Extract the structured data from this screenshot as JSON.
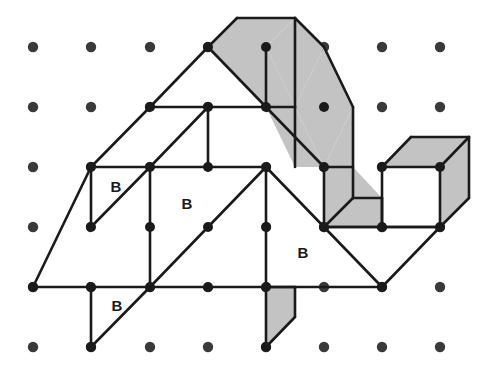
{
  "figure": {
    "background_color": "#ffffff",
    "line_color": "#1a1a1a",
    "dot_color": "#3a3a3a",
    "shaded_color": "#c3c3c3",
    "plain_color": "#ffffff",
    "line_width": 2.6,
    "dot_radius": 5.2,
    "vertex_radius": 5.0
  },
  "grid": {
    "columns": 8,
    "rows": 6,
    "origin_x": 33,
    "origin_y": 47,
    "spacing_x": 58.2,
    "spacing_y": 60.0,
    "dots": [
      {
        "col": 0,
        "row": 0,
        "x": 33,
        "y": 47
      },
      {
        "col": 1,
        "row": 0,
        "x": 91,
        "y": 47
      },
      {
        "col": 2,
        "row": 0,
        "x": 150,
        "y": 47
      },
      {
        "col": 3,
        "row": 0,
        "x": 208,
        "y": 47
      },
      {
        "col": 4,
        "row": 0,
        "x": 266,
        "y": 47
      },
      {
        "col": 5,
        "row": 0,
        "x": 324,
        "y": 47
      },
      {
        "col": 6,
        "row": 0,
        "x": 382,
        "y": 47
      },
      {
        "col": 7,
        "row": 0,
        "x": 440,
        "y": 47
      },
      {
        "col": 0,
        "row": 1,
        "x": 33,
        "y": 107
      },
      {
        "col": 1,
        "row": 1,
        "x": 91,
        "y": 107
      },
      {
        "col": 2,
        "row": 1,
        "x": 150,
        "y": 107
      },
      {
        "col": 3,
        "row": 1,
        "x": 208,
        "y": 107
      },
      {
        "col": 4,
        "row": 1,
        "x": 266,
        "y": 107
      },
      {
        "col": 5,
        "row": 1,
        "x": 324,
        "y": 107
      },
      {
        "col": 6,
        "row": 1,
        "x": 382,
        "y": 107
      },
      {
        "col": 7,
        "row": 1,
        "x": 440,
        "y": 107
      },
      {
        "col": 0,
        "row": 2,
        "x": 33,
        "y": 167
      },
      {
        "col": 1,
        "row": 2,
        "x": 91,
        "y": 167
      },
      {
        "col": 2,
        "row": 2,
        "x": 150,
        "y": 167
      },
      {
        "col": 3,
        "row": 2,
        "x": 208,
        "y": 167
      },
      {
        "col": 4,
        "row": 2,
        "x": 266,
        "y": 167
      },
      {
        "col": 5,
        "row": 2,
        "x": 324,
        "y": 167
      },
      {
        "col": 6,
        "row": 2,
        "x": 382,
        "y": 167
      },
      {
        "col": 7,
        "row": 2,
        "x": 440,
        "y": 167
      },
      {
        "col": 0,
        "row": 3,
        "x": 33,
        "y": 227
      },
      {
        "col": 1,
        "row": 3,
        "x": 91,
        "y": 227
      },
      {
        "col": 2,
        "row": 3,
        "x": 150,
        "y": 227
      },
      {
        "col": 3,
        "row": 3,
        "x": 208,
        "y": 227
      },
      {
        "col": 4,
        "row": 3,
        "x": 266,
        "y": 227
      },
      {
        "col": 5,
        "row": 3,
        "x": 324,
        "y": 227
      },
      {
        "col": 6,
        "row": 3,
        "x": 382,
        "y": 227
      },
      {
        "col": 7,
        "row": 3,
        "x": 440,
        "y": 227
      },
      {
        "col": 0,
        "row": 4,
        "x": 33,
        "y": 287
      },
      {
        "col": 1,
        "row": 4,
        "x": 91,
        "y": 287
      },
      {
        "col": 2,
        "row": 4,
        "x": 150,
        "y": 287
      },
      {
        "col": 3,
        "row": 4,
        "x": 208,
        "y": 287
      },
      {
        "col": 4,
        "row": 4,
        "x": 266,
        "y": 287
      },
      {
        "col": 5,
        "row": 4,
        "x": 324,
        "y": 287
      },
      {
        "col": 6,
        "row": 4,
        "x": 382,
        "y": 287
      },
      {
        "col": 7,
        "row": 4,
        "x": 440,
        "y": 287
      },
      {
        "col": 0,
        "row": 5,
        "x": 33,
        "y": 347
      },
      {
        "col": 1,
        "row": 5,
        "x": 91,
        "y": 347
      },
      {
        "col": 2,
        "row": 5,
        "x": 150,
        "y": 347
      },
      {
        "col": 3,
        "row": 5,
        "x": 208,
        "y": 347
      },
      {
        "col": 4,
        "row": 5,
        "x": 266,
        "y": 347
      },
      {
        "col": 5,
        "row": 5,
        "x": 324,
        "y": 347
      },
      {
        "col": 6,
        "row": 5,
        "x": 382,
        "y": 347
      },
      {
        "col": 7,
        "row": 5,
        "x": 440,
        "y": 347
      }
    ]
  },
  "shaded_faces": [
    {
      "id": "top-band-left",
      "points": "208,47 237,18 295,18 266,47"
    },
    {
      "id": "top-band-left-lower",
      "points": "208,47 266,47 295,107 266,107"
    },
    {
      "id": "top-band-mid",
      "points": "266,47 295,18 324,47 295,107"
    },
    {
      "id": "top-band-mid-lower",
      "points": "266,107 295,107 324,167 295,167"
    },
    {
      "id": "top-band-right",
      "points": "295,107 324,47 353,107 324,167"
    },
    {
      "id": "band-right-side",
      "points": "324,167 353,107 353,170 324,227"
    },
    {
      "id": "band-side-lower",
      "points": "324,167 324,227 353,227 353,167"
    },
    {
      "id": "elbow-bottom",
      "points": "324,227 353,227 382,227 382,198 353,198"
    },
    {
      "id": "elbow-inner",
      "points": "324,227 324,167 353,167 382,198 353,198 353,227"
    },
    {
      "id": "cube-top",
      "points": "382,167 411,137 469,137 440,167"
    },
    {
      "id": "cube-right",
      "points": "440,167 469,137 469,198 440,227"
    },
    {
      "id": "bottom-fin",
      "points": "266,287 295,287 295,317 266,347"
    }
  ],
  "plain_faces": [
    {
      "id": "cube-front",
      "points": "382,167 440,167 440,227 382,227"
    },
    {
      "id": "upper-left-quad",
      "points": "150,107 208,107 208,167 150,167"
    },
    {
      "id": "upper-right-quad",
      "points": "208,107 266,107 266,167 208,167"
    },
    {
      "id": "mid-left-quad",
      "points": "91,167 150,167 150,227 91,227"
    },
    {
      "id": "mid-center-quad",
      "points": "150,167 266,167 266,287 150,287"
    },
    {
      "id": "lower-left-quad",
      "points": "91,227 150,227 150,287 91,287"
    }
  ],
  "edges": [
    {
      "id": "apex-left",
      "x1": 237,
      "y1": 18,
      "x2": 208,
      "y2": 47
    },
    {
      "id": "apex-right",
      "x1": 237,
      "y1": 18,
      "x2": 295,
      "y2": 18
    },
    {
      "id": "band-top-1",
      "x1": 295,
      "y1": 18,
      "x2": 324,
      "y2": 47
    },
    {
      "id": "band-top-2",
      "x1": 324,
      "y1": 47,
      "x2": 353,
      "y2": 107
    },
    {
      "id": "band-top-3",
      "x1": 353,
      "y1": 107,
      "x2": 353,
      "y2": 198
    },
    {
      "id": "ridge-left-down",
      "x1": 208,
      "y1": 47,
      "x2": 150,
      "y2": 107
    },
    {
      "id": "ridge-left-down2",
      "x1": 150,
      "y1": 107,
      "x2": 91,
      "y2": 167
    },
    {
      "id": "ridge-left-down3",
      "x1": 91,
      "y1": 167,
      "x2": 33,
      "y2": 287
    },
    {
      "id": "band-under-1",
      "x1": 208,
      "y1": 47,
      "x2": 266,
      "y2": 107
    },
    {
      "id": "band-under-2",
      "x1": 266,
      "y1": 107,
      "x2": 324,
      "y2": 167
    },
    {
      "id": "band-under-3",
      "x1": 324,
      "y1": 167,
      "x2": 324,
      "y2": 227
    },
    {
      "id": "band-crease-1",
      "x1": 266,
      "y1": 47,
      "x2": 266,
      "y2": 107
    },
    {
      "id": "band-crease-2",
      "x1": 295,
      "y1": 18,
      "x2": 295,
      "y2": 107
    },
    {
      "id": "band-crease-3",
      "x1": 295,
      "y1": 107,
      "x2": 295,
      "y2": 167
    },
    {
      "id": "band-crease-4",
      "x1": 266,
      "y1": 107,
      "x2": 295,
      "y2": 107
    },
    {
      "id": "band-crease-5",
      "x1": 324,
      "y1": 167,
      "x2": 353,
      "y2": 167
    },
    {
      "id": "hline-row1",
      "x1": 150,
      "y1": 107,
      "x2": 266,
      "y2": 107
    },
    {
      "id": "hline-row2-left",
      "x1": 91,
      "y1": 167,
      "x2": 266,
      "y2": 167
    },
    {
      "id": "vline-c3-r1r2",
      "x1": 208,
      "y1": 107,
      "x2": 208,
      "y2": 167
    },
    {
      "id": "vline-c1-r2r4",
      "x1": 91,
      "y1": 167,
      "x2": 91,
      "y2": 227
    },
    {
      "id": "vline-c2-r2r4",
      "x1": 150,
      "y1": 167,
      "x2": 150,
      "y2": 287
    },
    {
      "id": "vline-c4-r2r4",
      "x1": 266,
      "y1": 167,
      "x2": 266,
      "y2": 287
    },
    {
      "id": "diag-mid-1",
      "x1": 150,
      "y1": 167,
      "x2": 208,
      "y2": 107
    },
    {
      "id": "diag-mid-2",
      "x1": 91,
      "y1": 227,
      "x2": 150,
      "y2": 167
    },
    {
      "id": "diag-mid-3",
      "x1": 150,
      "y1": 287,
      "x2": 266,
      "y2": 167
    },
    {
      "id": "diag-right-1",
      "x1": 266,
      "y1": 167,
      "x2": 324,
      "y2": 227
    },
    {
      "id": "diag-right-2",
      "x1": 324,
      "y1": 227,
      "x2": 382,
      "y2": 287
    },
    {
      "id": "diag-right-3",
      "x1": 382,
      "y1": 287,
      "x2": 440,
      "y2": 227
    },
    {
      "id": "hline-row4",
      "x1": 33,
      "y1": 287,
      "x2": 382,
      "y2": 287
    },
    {
      "id": "hline-row3-right",
      "x1": 324,
      "y1": 227,
      "x2": 440,
      "y2": 227
    },
    {
      "id": "bottom-left-v",
      "x1": 91,
      "y1": 287,
      "x2": 91,
      "y2": 347
    },
    {
      "id": "bottom-left-diag",
      "x1": 91,
      "y1": 347,
      "x2": 150,
      "y2": 287
    },
    {
      "id": "bottom-fin-v",
      "x1": 266,
      "y1": 287,
      "x2": 266,
      "y2": 347
    },
    {
      "id": "bottom-fin-diag",
      "x1": 266,
      "y1": 347,
      "x2": 295,
      "y2": 317
    },
    {
      "id": "bottom-fin-top",
      "x1": 266,
      "y1": 287,
      "x2": 295,
      "y2": 287
    },
    {
      "id": "bottom-fin-r",
      "x1": 295,
      "y1": 287,
      "x2": 295,
      "y2": 317
    },
    {
      "id": "cube-top-back-l",
      "x1": 382,
      "y1": 167,
      "x2": 411,
      "y2": 137
    },
    {
      "id": "cube-top-back-t",
      "x1": 411,
      "y1": 137,
      "x2": 469,
      "y2": 137
    },
    {
      "id": "cube-top-back-r",
      "x1": 469,
      "y1": 137,
      "x2": 440,
      "y2": 167
    },
    {
      "id": "cube-right-v",
      "x1": 469,
      "y1": 137,
      "x2": 469,
      "y2": 198
    },
    {
      "id": "cube-right-b",
      "x1": 469,
      "y1": 198,
      "x2": 440,
      "y2": 227
    },
    {
      "id": "cube-front-t",
      "x1": 382,
      "y1": 167,
      "x2": 440,
      "y2": 167
    },
    {
      "id": "cube-front-l",
      "x1": 382,
      "y1": 167,
      "x2": 382,
      "y2": 227
    },
    {
      "id": "cube-front-r",
      "x1": 440,
      "y1": 167,
      "x2": 440,
      "y2": 227
    },
    {
      "id": "cube-front-b",
      "x1": 382,
      "y1": 227,
      "x2": 440,
      "y2": 227
    },
    {
      "id": "elbow-top",
      "x1": 353,
      "y1": 198,
      "x2": 382,
      "y2": 198
    },
    {
      "id": "elbow-right-v",
      "x1": 382,
      "y1": 198,
      "x2": 382,
      "y2": 227
    },
    {
      "id": "elbow-bottom-h",
      "x1": 324,
      "y1": 227,
      "x2": 382,
      "y2": 227
    },
    {
      "id": "elbow-diag",
      "x1": 324,
      "y1": 227,
      "x2": 353,
      "y2": 198
    }
  ],
  "vertices": [
    {
      "id": "v-208-47",
      "x": 208,
      "y": 47
    },
    {
      "id": "v-266-47",
      "x": 266,
      "y": 47
    },
    {
      "id": "v-150-107",
      "x": 150,
      "y": 107
    },
    {
      "id": "v-208-107",
      "x": 208,
      "y": 107
    },
    {
      "id": "v-266-107",
      "x": 266,
      "y": 107
    },
    {
      "id": "v-324-107",
      "x": 324,
      "y": 107
    },
    {
      "id": "v-91-167",
      "x": 91,
      "y": 167
    },
    {
      "id": "v-150-167",
      "x": 150,
      "y": 167
    },
    {
      "id": "v-208-167",
      "x": 208,
      "y": 167
    },
    {
      "id": "v-266-167",
      "x": 266,
      "y": 167
    },
    {
      "id": "v-324-167",
      "x": 324,
      "y": 167
    },
    {
      "id": "v-382-167",
      "x": 382,
      "y": 167
    },
    {
      "id": "v-440-167",
      "x": 440,
      "y": 167
    },
    {
      "id": "v-91-227",
      "x": 91,
      "y": 227
    },
    {
      "id": "v-150-227",
      "x": 150,
      "y": 227
    },
    {
      "id": "v-208-227",
      "x": 208,
      "y": 227
    },
    {
      "id": "v-266-227",
      "x": 266,
      "y": 227
    },
    {
      "id": "v-324-227",
      "x": 324,
      "y": 227
    },
    {
      "id": "v-382-227",
      "x": 382,
      "y": 227
    },
    {
      "id": "v-440-227",
      "x": 440,
      "y": 227
    },
    {
      "id": "v-33-287",
      "x": 33,
      "y": 287
    },
    {
      "id": "v-91-287",
      "x": 91,
      "y": 287
    },
    {
      "id": "v-150-287",
      "x": 150,
      "y": 287
    },
    {
      "id": "v-208-287",
      "x": 208,
      "y": 287
    },
    {
      "id": "v-266-287",
      "x": 266,
      "y": 287
    },
    {
      "id": "v-382-287",
      "x": 382,
      "y": 287
    },
    {
      "id": "v-91-347",
      "x": 91,
      "y": 347
    },
    {
      "id": "v-266-347",
      "x": 266,
      "y": 347
    }
  ],
  "labels": [
    {
      "id": "label-b-1",
      "text": "B",
      "x": 116,
      "y": 188
    },
    {
      "id": "label-b-2",
      "text": "B",
      "x": 187,
      "y": 205
    },
    {
      "id": "label-b-3",
      "text": "B",
      "x": 303,
      "y": 254
    },
    {
      "id": "label-b-4",
      "text": "B",
      "x": 117,
      "y": 307
    }
  ]
}
